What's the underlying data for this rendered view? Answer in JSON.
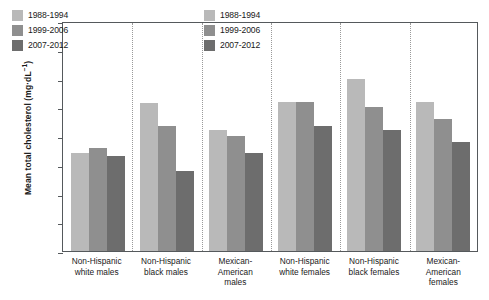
{
  "chart_data": {
    "type": "bar",
    "title": "",
    "xlabel": "",
    "ylabel": "Mean total cholesterol (mg·dL",
    "ylabel_sup": "−1",
    "ylabel_tail": ")",
    "ylim": [
      140,
      180
    ],
    "ytick_step": 5,
    "yticks": [
      180,
      175,
      170,
      165,
      160,
      155,
      150,
      145,
      140
    ],
    "grid": false,
    "legend_position": "inside-top-left and inside-top-center",
    "categories": [
      "Non-Hispanic white males",
      "Non-Hispanic black males",
      "Mexican-American males",
      "Non-Hispanic white females",
      "Non-Hispanic black females",
      "Mexican-American females"
    ],
    "category_lines": [
      [
        "Non-Hispanic",
        "white males"
      ],
      [
        "Non-Hispanic",
        "black males"
      ],
      [
        "Mexican-",
        "American",
        "males"
      ],
      [
        "Non-Hispanic",
        "white females"
      ],
      [
        "Non-Hispanic",
        "black females"
      ],
      [
        "Mexican-",
        "American",
        "females"
      ]
    ],
    "series": [
      {
        "name": "1988-1994",
        "color": "#b9b9b9",
        "values": [
          157.0,
          165.8,
          161.0,
          166.0,
          170.0,
          166.0
        ]
      },
      {
        "name": "1999-2006",
        "color": "#8f8f8f",
        "values": [
          158.0,
          161.7,
          160.0,
          166.0,
          165.0,
          163.0
        ]
      },
      {
        "name": "2007-2012",
        "color": "#6d6d6d",
        "values": [
          156.5,
          154.0,
          157.0,
          161.7,
          161.0,
          159.0
        ]
      }
    ]
  },
  "legends": [
    {
      "id": "legend-left",
      "entries": [
        {
          "label": "1988-1994",
          "color": "#b9b9b9"
        },
        {
          "label": "1999-2006",
          "color": "#8f8f8f"
        },
        {
          "label": "2007-2012",
          "color": "#6d6d6d"
        }
      ]
    },
    {
      "id": "legend-right",
      "entries": [
        {
          "label": "1988-1994",
          "color": "#b9b9b9"
        },
        {
          "label": "1999-2006",
          "color": "#8f8f8f"
        },
        {
          "label": "2007-2012",
          "color": "#6d6d6d"
        }
      ]
    }
  ],
  "axis": {
    "frame_color": "#55595c",
    "separator_color": "#9a9a9a"
  }
}
